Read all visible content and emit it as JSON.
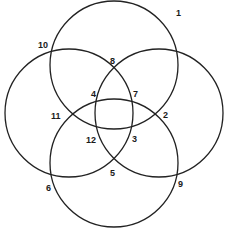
{
  "diagram": {
    "type": "four-circle-venn",
    "stroke_color": "#222222",
    "background": "#ffffff",
    "circles": [
      {
        "name": "top",
        "cx": 114,
        "cy": 65,
        "r": 64
      },
      {
        "name": "left",
        "cx": 69,
        "cy": 113,
        "r": 64
      },
      {
        "name": "right",
        "cx": 159,
        "cy": 113,
        "r": 64
      },
      {
        "name": "bottom",
        "cx": 114,
        "cy": 163,
        "r": 64
      }
    ],
    "labels": [
      {
        "text": "1",
        "x": 176,
        "y": 16
      },
      {
        "text": "2",
        "x": 163,
        "y": 118
      },
      {
        "text": "3",
        "x": 132,
        "y": 142
      },
      {
        "text": "4",
        "x": 91,
        "y": 97
      },
      {
        "text": "5",
        "x": 110,
        "y": 176
      },
      {
        "text": "6",
        "x": 46,
        "y": 191
      },
      {
        "text": "7",
        "x": 133,
        "y": 97
      },
      {
        "text": "8",
        "x": 110,
        "y": 64
      },
      {
        "text": "9",
        "x": 178,
        "y": 187
      },
      {
        "text": "10",
        "x": 38,
        "y": 48
      },
      {
        "text": "11",
        "x": 51,
        "y": 119
      },
      {
        "text": "12",
        "x": 86,
        "y": 143
      }
    ]
  }
}
